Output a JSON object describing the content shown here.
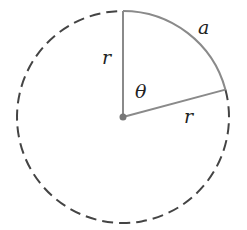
{
  "diagram": {
    "labels": {
      "arc": "a",
      "radius_vertical": "r",
      "radius_slanted": "r",
      "angle": "θ"
    },
    "geometry": {
      "center": [
        123,
        117
      ],
      "radius": 106,
      "sector_start_deg": 90,
      "sector_end_deg": 15
    },
    "colors": {
      "solid_line": "#8a8a8a",
      "dashed_line": "#444444",
      "center_dot": "#777777",
      "text": "#222222"
    }
  }
}
